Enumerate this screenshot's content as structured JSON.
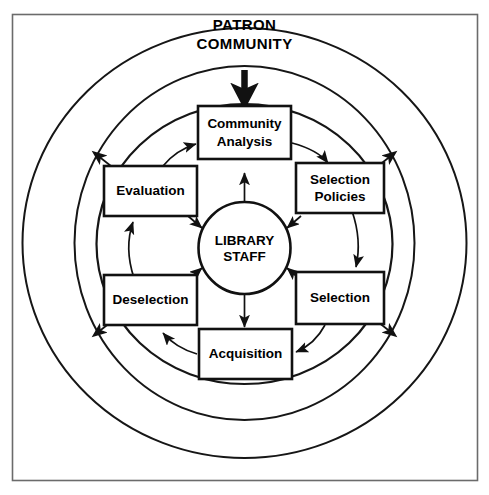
{
  "diagram": {
    "source_label": {
      "line1": "PATRON",
      "line2": "COMMUNITY"
    },
    "hub": {
      "line1": "LIBRARY",
      "line2": "STAFF"
    },
    "nodes": [
      {
        "id": "community-analysis",
        "line1": "Community",
        "line2": "Analysis"
      },
      {
        "id": "selection-policies",
        "line1": "Selection",
        "line2": "Policies"
      },
      {
        "id": "selection",
        "line1": "Selection",
        "line2": ""
      },
      {
        "id": "acquisition",
        "line1": "Acquisition",
        "line2": ""
      },
      {
        "id": "deselection",
        "line1": "Deselection",
        "line2": ""
      },
      {
        "id": "evaluation",
        "line1": "Evaluation",
        "line2": ""
      }
    ],
    "colors": {
      "stroke": "#111111",
      "frame": "#6b6b6b",
      "background": "#ffffff"
    }
  }
}
